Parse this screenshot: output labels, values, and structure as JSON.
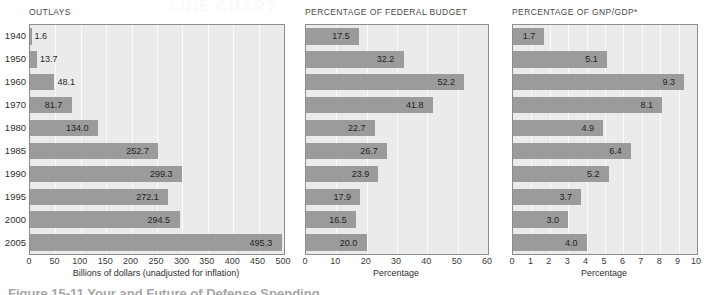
{
  "figure": {
    "bleed_text": "LINE CHART",
    "caption_partial": "Figure 15-11  Your and Future of Defense Spending"
  },
  "chart_data": [
    {
      "type": "bar",
      "orientation": "horizontal",
      "title": "OUTLAYS",
      "xlabel": "Billions of dollars (unadjusted for inflation)",
      "ylabel": "",
      "categories": [
        "1940",
        "1950",
        "1960",
        "1970",
        "1980",
        "1985",
        "1990",
        "1995",
        "2000",
        "2005"
      ],
      "values": [
        1.6,
        13.7,
        48.1,
        81.7,
        134.0,
        252.7,
        299.3,
        272.1,
        294.5,
        495.3
      ],
      "value_labels": [
        "1.6",
        "13.7",
        "48.1",
        "81.7",
        "134.0",
        "252.7",
        "299.3",
        "272.1",
        "294.5",
        "495.3"
      ],
      "xlim": [
        0,
        500
      ],
      "xticks": [
        0,
        50,
        100,
        150,
        200,
        250,
        300,
        350,
        400,
        450,
        500
      ],
      "xtick_labels": [
        "0",
        "50",
        "100",
        "150",
        "200",
        "250",
        "300",
        "350",
        "400",
        "450",
        "500"
      ],
      "grid": true,
      "legend": "none",
      "bar_color": "#9b9b9b",
      "plot_bg": "#ebebeb"
    },
    {
      "type": "bar",
      "orientation": "horizontal",
      "title": "PERCENTAGE OF FEDERAL BUDGET",
      "xlabel": "Percentage",
      "ylabel": "",
      "categories": [
        "1940",
        "1950",
        "1960",
        "1970",
        "1980",
        "1985",
        "1990",
        "1995",
        "2000",
        "2005"
      ],
      "values": [
        17.5,
        32.2,
        52.2,
        41.8,
        22.7,
        26.7,
        23.9,
        17.9,
        16.5,
        20.0
      ],
      "value_labels": [
        "17.5",
        "32.2",
        "52.2",
        "41.8",
        "22.7",
        "26.7",
        "23.9",
        "17.9",
        "16.5",
        "20.0"
      ],
      "xlim": [
        0,
        60
      ],
      "xticks": [
        0,
        10,
        20,
        30,
        40,
        50,
        60
      ],
      "xtick_labels": [
        "0",
        "10",
        "20",
        "30",
        "40",
        "50",
        "60"
      ],
      "grid": true,
      "legend": "none",
      "bar_color": "#9b9b9b",
      "plot_bg": "#ebebeb"
    },
    {
      "type": "bar",
      "orientation": "horizontal",
      "title": "PERCENTAGE OF GNP/GDP*",
      "xlabel": "Percentage",
      "ylabel": "",
      "categories": [
        "1940",
        "1950",
        "1960",
        "1970",
        "1980",
        "1985",
        "1990",
        "1995",
        "2000",
        "2005"
      ],
      "values": [
        1.7,
        5.1,
        9.3,
        8.1,
        4.9,
        6.4,
        5.2,
        3.7,
        3.0,
        4.0
      ],
      "value_labels": [
        "1.7",
        "5.1",
        "9.3",
        "8.1",
        "4.9",
        "6.4",
        "5.2",
        "3.7",
        "3.0",
        "4.0"
      ],
      "xlim": [
        0,
        10
      ],
      "xticks": [
        0,
        1,
        2,
        3,
        4,
        5,
        6,
        7,
        8,
        9,
        10
      ],
      "xtick_labels": [
        "0",
        "1",
        "2",
        "3",
        "4",
        "5",
        "6",
        "7",
        "8",
        "9",
        "10"
      ],
      "grid": true,
      "legend": "none",
      "bar_color": "#9b9b9b",
      "plot_bg": "#ebebeb"
    }
  ]
}
